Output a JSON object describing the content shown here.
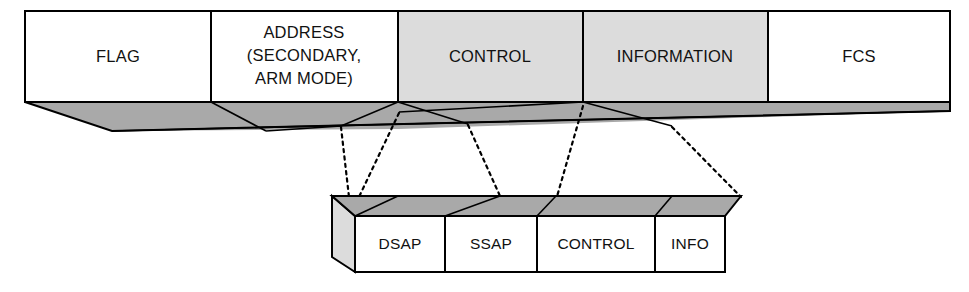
{
  "diagram": {
    "colors": {
      "face_white": "#ffffff",
      "face_gray": "#dcdcdc",
      "band_gray": "#a9a9a9",
      "stroke": "#000000",
      "background": "#ffffff"
    },
    "main_frame": {
      "name": "outer-frame",
      "fields": [
        {
          "id": "flag",
          "label": "FLAG",
          "lines": [
            "FLAG"
          ],
          "shaded": false,
          "x0": 25,
          "x1": 211
        },
        {
          "id": "address",
          "label": "ADDRESS (SECONDARY, ARM MODE)",
          "lines": [
            "ADDRESS",
            "(SECONDARY,",
            "ARM MODE)"
          ],
          "shaded": false,
          "x0": 211,
          "x1": 398
        },
        {
          "id": "control",
          "label": "CONTROL",
          "lines": [
            "CONTROL"
          ],
          "shaded": true,
          "x0": 398,
          "x1": 583
        },
        {
          "id": "information",
          "label": "INFORMATION",
          "lines": [
            "INFORMATION"
          ],
          "shaded": true,
          "x0": 583,
          "x1": 768
        },
        {
          "id": "fcs",
          "label": "FCS",
          "lines": [
            "FCS"
          ],
          "shaded": false,
          "x0": 768,
          "x1": 950
        }
      ]
    },
    "sub_frame": {
      "name": "llc-pdu",
      "fields": [
        {
          "id": "dsap",
          "label": "DSAP",
          "x0": 355,
          "x1": 445
        },
        {
          "id": "ssap",
          "label": "SSAP",
          "x0": 445,
          "x1": 537
        },
        {
          "id": "control",
          "label": "CONTROL",
          "x0": 537,
          "x1": 655
        },
        {
          "id": "info",
          "label": "INFO",
          "x0": 655,
          "x1": 725
        }
      ]
    },
    "connectors": [
      {
        "id": "connector-dsap-left",
        "from_x": 341,
        "from_y": 126,
        "to_x": 349,
        "to_y": 196
      },
      {
        "id": "connector-dsap-right",
        "from_x": 399,
        "from_y": 112,
        "to_x": 358,
        "to_y": 198
      },
      {
        "id": "connector-ssap-right",
        "from_x": 468,
        "from_y": 124,
        "to_x": 499,
        "to_y": 195
      },
      {
        "id": "connector-control-right",
        "from_x": 583,
        "from_y": 105,
        "to_x": 556,
        "to_y": 199
      },
      {
        "id": "connector-info-right",
        "from_x": 672,
        "from_y": 126,
        "to_x": 740,
        "to_y": 196
      }
    ]
  }
}
